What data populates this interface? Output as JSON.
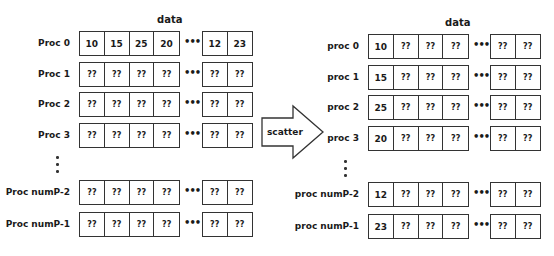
{
  "left": {
    "title": "data",
    "rows": [
      {
        "label": "Proc 0",
        "group1": [
          "10",
          "15",
          "25",
          "20"
        ],
        "group2": [
          "12",
          "23"
        ]
      },
      {
        "label": "Proc 1",
        "group1": [
          "??",
          "??",
          "??",
          "??"
        ],
        "group2": [
          "??",
          "??"
        ]
      },
      {
        "label": "Proc 2",
        "group1": [
          "??",
          "??",
          "??",
          "??"
        ],
        "group2": [
          "??",
          "??"
        ]
      },
      {
        "label": "Proc 3",
        "group1": [
          "??",
          "??",
          "??",
          "??"
        ],
        "group2": [
          "??",
          "??"
        ]
      },
      {
        "label": "Proc numP-2",
        "group1": [
          "??",
          "??",
          "??",
          "??"
        ],
        "group2": [
          "??",
          "??"
        ]
      },
      {
        "label": "Proc numP-1",
        "group1": [
          "??",
          "??",
          "??",
          "??"
        ],
        "group2": [
          "??",
          "??"
        ]
      }
    ]
  },
  "arrow": {
    "label": "scatter"
  },
  "right": {
    "title": "data",
    "rows": [
      {
        "label": "proc 0",
        "group1": [
          "10",
          "??",
          "??",
          "??"
        ],
        "group2": [
          "??",
          "??"
        ]
      },
      {
        "label": "proc 1",
        "group1": [
          "15",
          "??",
          "??",
          "??"
        ],
        "group2": [
          "??",
          "??"
        ]
      },
      {
        "label": "proc 2",
        "group1": [
          "25",
          "??",
          "??",
          "??"
        ],
        "group2": [
          "??",
          "??"
        ]
      },
      {
        "label": "proc 3",
        "group1": [
          "20",
          "??",
          "??",
          "??"
        ],
        "group2": [
          "??",
          "??"
        ]
      },
      {
        "label": "proc numP-2",
        "group1": [
          "12",
          "??",
          "??",
          "??"
        ],
        "group2": [
          "??",
          "??"
        ]
      },
      {
        "label": "proc numP-1",
        "group1": [
          "23",
          "??",
          "??",
          "??"
        ],
        "group2": [
          "??",
          "??"
        ]
      }
    ]
  },
  "ellipsis": "•••"
}
